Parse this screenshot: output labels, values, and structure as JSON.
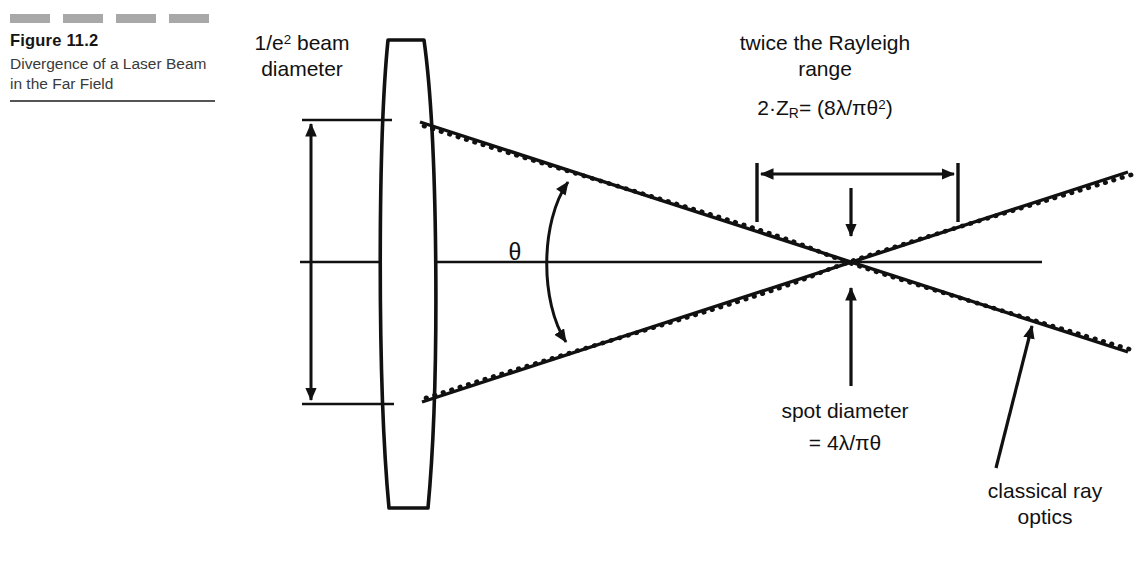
{
  "figure": {
    "number": "Figure 11.2",
    "title": "Divergence of a Laser Beam in the Far Field",
    "decoration_dash_count": 4,
    "decoration_color": "#a8a8a8",
    "rule_color": "#555555"
  },
  "diagram": {
    "type": "optics-ray-diagram",
    "background": "#ffffff",
    "ink_color": "#111111",
    "labels": {
      "beam_diameter": "1/e² beam diameter",
      "beam_diameter_line1": "1/e",
      "beam_diameter_sup": "2",
      "beam_diameter_line1_rest": " beam",
      "beam_diameter_line2": "diameter",
      "rayleigh_line1": "twice the Rayleigh",
      "rayleigh_line2": "range",
      "rayleigh_formula_prefix": "2·Z",
      "rayleigh_formula_sub": "R",
      "rayleigh_formula_rest": "= (8λ/πθ",
      "rayleigh_formula_sup": "2",
      "rayleigh_formula_close": ")",
      "theta": "θ",
      "spot_diameter": "spot diameter",
      "spot_formula": "= 4λ/πθ",
      "classical_line1": "classical ray",
      "classical_line2": "optics"
    },
    "elements": [
      "biconvex-lens",
      "optical-axis",
      "beam-diameter-dimension-arrow",
      "divergence-angle-arc",
      "gaussian-beam-envelope-dotted",
      "classical-ray-lines-solid",
      "rayleigh-range-dimension-arrow",
      "spot-diameter-pointer-arrows",
      "classical-ray-optics-pointer-arrow"
    ]
  }
}
